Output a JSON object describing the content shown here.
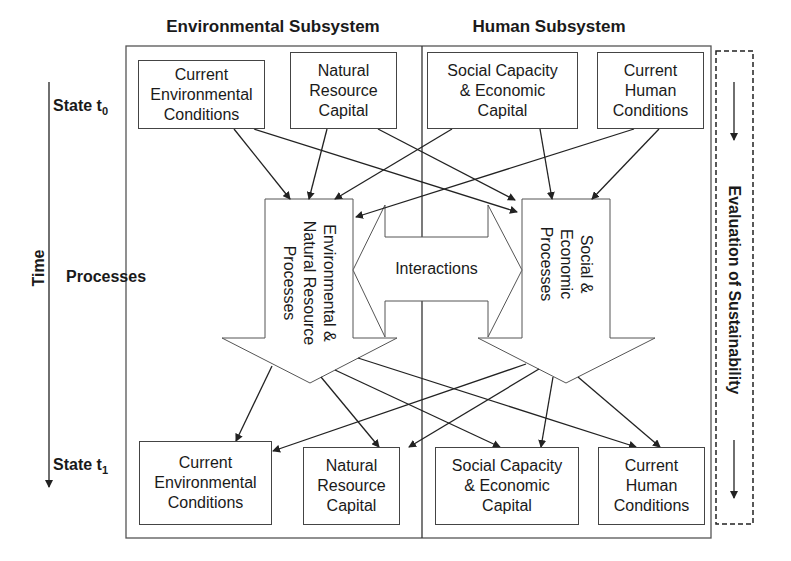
{
  "headers": {
    "environmental": "Environmental Subsystem",
    "human": "Human Subsystem"
  },
  "time_axis": {
    "label": "Time",
    "state_t0": {
      "prefix": "State t",
      "sub": "0"
    },
    "processes": "Processes",
    "state_t1": {
      "prefix": "State t",
      "sub": "1"
    }
  },
  "top_row": [
    {
      "id": "env-conditions-t0",
      "label": "Current\nEnvironmental\nConditions"
    },
    {
      "id": "natural-resource-capital-t0",
      "label": "Natural\nResource\nCapital"
    },
    {
      "id": "social-economic-capital-t0",
      "label": "Social Capacity\n& Economic\nCapital"
    },
    {
      "id": "human-conditions-t0",
      "label": "Current\nHuman\nConditions"
    }
  ],
  "processes": {
    "environmental": "Environmental &\nNatural Resource\nProcesses",
    "social": "Social &\nEconomic\nProcesses",
    "interactions": "Interactions"
  },
  "bottom_row": [
    {
      "id": "env-conditions-t1",
      "label": "Current\nEnvironmental\nConditions"
    },
    {
      "id": "natural-resource-capital-t1",
      "label": "Natural\nResource\nCapital"
    },
    {
      "id": "social-economic-capital-t1",
      "label": "Social Capacity\n& Economic\nCapital"
    },
    {
      "id": "human-conditions-t1",
      "label": "Current\nHuman\nConditions"
    }
  ],
  "evaluation": {
    "label": "Evaluation of Sustainability"
  },
  "colors": {
    "line": "#333333",
    "frame": "#555555",
    "text": "#1a1a1a"
  }
}
